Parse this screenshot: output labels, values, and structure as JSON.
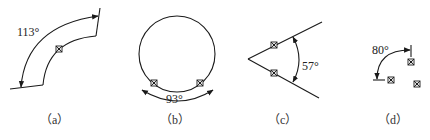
{
  "figures": [
    {
      "id": "a",
      "caption": "（a）",
      "angle_label": "113°"
    },
    {
      "id": "b",
      "caption": "（b）",
      "angle_label": "93°"
    },
    {
      "id": "c",
      "caption": "（c）",
      "angle_label": "57°"
    },
    {
      "id": "d",
      "caption": "（d）",
      "angle_label": "80°"
    }
  ],
  "icons": {
    "marker": "boxed-x-marker"
  },
  "colors": {
    "stroke": "#1a1a1a",
    "background": "#ffffff"
  }
}
